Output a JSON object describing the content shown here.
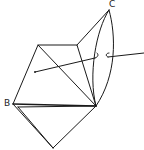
{
  "figure": {
    "type": "geometry-diagram",
    "stroke_color": "#1a1a1a",
    "background": "#ffffff"
  },
  "labels": {
    "B": "B",
    "C": "C"
  },
  "points": {
    "C": [
      109,
      10
    ],
    "P_top_left": [
      38,
      45
    ],
    "P_top_right": [
      77,
      45
    ],
    "B": [
      13,
      104
    ],
    "B_inner": [
      18,
      107
    ],
    "R": [
      96,
      106
    ],
    "Bottom": [
      53,
      148
    ],
    "Axis_start": [
      35,
      72
    ],
    "Axis_mid1": [
      97,
      57
    ],
    "Axis_mid2": [
      107,
      56
    ],
    "Axis_end": [
      144,
      52
    ]
  }
}
